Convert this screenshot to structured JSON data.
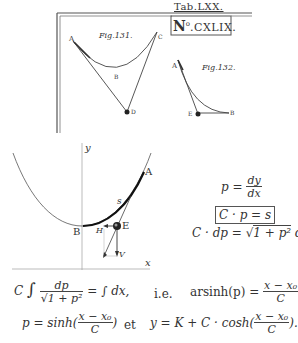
{
  "plate": {
    "tab_label": "Tab.LXX.",
    "number_label": "N.°CXLIX.",
    "number_prefix": "N",
    "number_sup": "o",
    "number_rest": ".CXLIX.",
    "fig131": {
      "caption": "Fig.131.",
      "points": {
        "A": "A",
        "B": "B",
        "C": "C",
        "D": "D"
      }
    },
    "fig132": {
      "caption": "Fig.132.",
      "points": {
        "A": "A",
        "B": "B",
        "E": "E"
      }
    }
  },
  "modern_diagram": {
    "axis_x_label": "x",
    "axis_y_label": "y",
    "point_A": "A",
    "point_B": "B",
    "point_E": "E",
    "arc_label": "s",
    "force_H": "H",
    "force_V": "V"
  },
  "equations": {
    "p_lhs": "p =",
    "p_num": "dy",
    "p_den": "dx",
    "boxed": "C · p = s",
    "cdp_lhs": "C · dp =",
    "cdp_sqrt": "1 + p²",
    "cdp_rhs": "dx",
    "integral_C": "C",
    "integral_sym": "∫",
    "integral_num": "dp",
    "integral_den_sqrt": "1 + p²",
    "integral_rhs": "= ∫ dx,",
    "ie": "i.e.",
    "arsinh_lhs": "arsinh(p) =",
    "arsinh_num": "x − x₀",
    "arsinh_den": "C",
    "arsinh_end": ",",
    "p_sinh_lhs": "p = sinh(",
    "p_sinh_num": "x − x₀",
    "p_sinh_den": "C",
    "p_sinh_end": ")",
    "et": "et",
    "y_lhs": "y = K + C · cosh(",
    "y_num": "x − x₀",
    "y_den": "C",
    "y_end": ")."
  }
}
